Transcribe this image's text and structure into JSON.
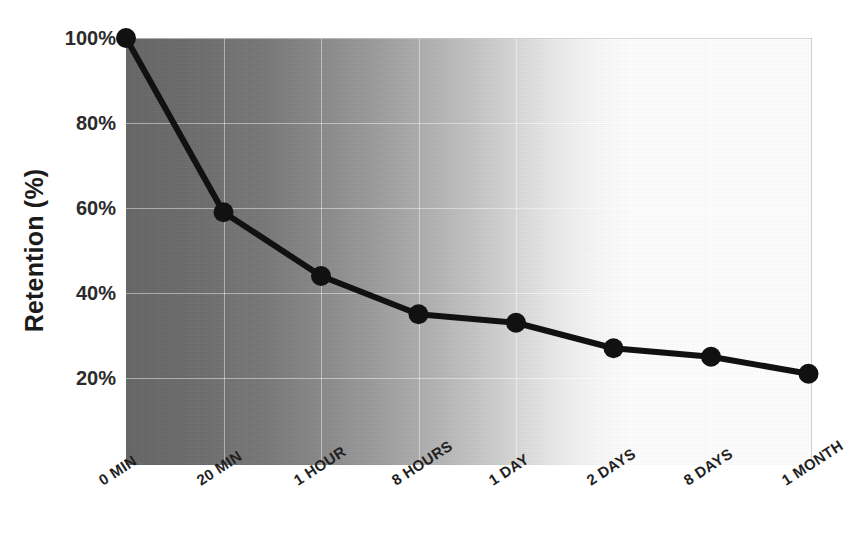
{
  "chart_data": {
    "type": "line",
    "title": "",
    "xlabel": "",
    "ylabel": "Retention (%)",
    "categories": [
      "0 MIN",
      "20 MIN",
      "1 HOUR",
      "8 HOURS",
      "1 DAY",
      "2 DAYS",
      "8 DAYS",
      "1 MONTH"
    ],
    "values": [
      100,
      59,
      44,
      35,
      33,
      27,
      25,
      21
    ],
    "value_labels": [
      "100%",
      "59%",
      "44%",
      "35%",
      "33%",
      "27%",
      "25%",
      "21%"
    ],
    "ylim": [
      0,
      100
    ],
    "ytick_values": [
      20,
      40,
      60,
      80,
      100
    ],
    "ytick_labels": [
      "20%",
      "40%",
      "60%",
      "80%",
      "100%"
    ],
    "grid": true,
    "legend": "none",
    "series": [
      {
        "name": "Retention",
        "values": [
          100,
          59,
          44,
          35,
          33,
          27,
          25,
          21
        ]
      }
    ],
    "marker": "circle",
    "line_color": "#111111",
    "marker_color": "#111111",
    "background_gradient": {
      "from": "#666666",
      "to": "#ffffff",
      "direction": "left-to-right"
    }
  },
  "axes": {
    "y_title": "Retention (%)"
  },
  "icons": {
    "data_point": "filled-circle-marker"
  }
}
